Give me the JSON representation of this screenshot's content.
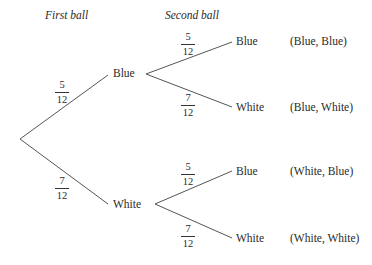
{
  "headers": {
    "first": "First ball",
    "second": "Second ball"
  },
  "first_level": {
    "blue": {
      "label": "Blue",
      "prob": {
        "num": "5",
        "den": "12"
      }
    },
    "white": {
      "label": "White",
      "prob": {
        "num": "7",
        "den": "12"
      }
    }
  },
  "second_level": {
    "blue_blue": {
      "label": "Blue",
      "prob": {
        "num": "5",
        "den": "12"
      },
      "outcome": "(Blue, Blue)"
    },
    "blue_white": {
      "label": "White",
      "prob": {
        "num": "7",
        "den": "12"
      },
      "outcome": "(Blue, White)"
    },
    "white_blue": {
      "label": "Blue",
      "prob": {
        "num": "5",
        "den": "12"
      },
      "outcome": "(White, Blue)"
    },
    "white_white": {
      "label": "White",
      "prob": {
        "num": "7",
        "den": "12"
      },
      "outcome": "(White, White)"
    }
  },
  "colors": {
    "line": "#555555",
    "text": "#2a2a2a"
  }
}
